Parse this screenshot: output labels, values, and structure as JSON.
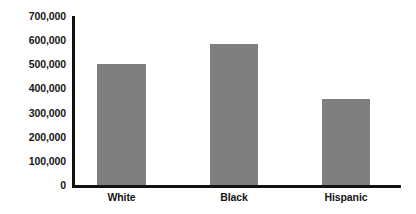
{
  "chart_data": {
    "type": "bar",
    "title": "",
    "subtitle": "",
    "xlabel": "",
    "ylabel": "",
    "categories": [
      "White",
      "Black",
      "Hispanic"
    ],
    "values": [
      500000,
      585000,
      355000
    ],
    "series": [
      {
        "name": "Count",
        "values": [
          500000,
          585000,
          355000
        ]
      }
    ],
    "ylim": [
      0,
      700000
    ],
    "ytick_values": [
      700000,
      600000,
      500000,
      400000,
      300000,
      200000,
      100000,
      0
    ],
    "ytick_labels": [
      "700,000",
      "600,000",
      "500,000",
      "400,000",
      "300,000",
      "200,000",
      "100,000",
      "0"
    ],
    "ytick_step": 100000,
    "grid": false,
    "legend": false,
    "legend_position": "none",
    "bar_color": "#7f7f7f",
    "axis_color": "#111111",
    "background_color": "#ffffff",
    "text_color": "#161616"
  }
}
